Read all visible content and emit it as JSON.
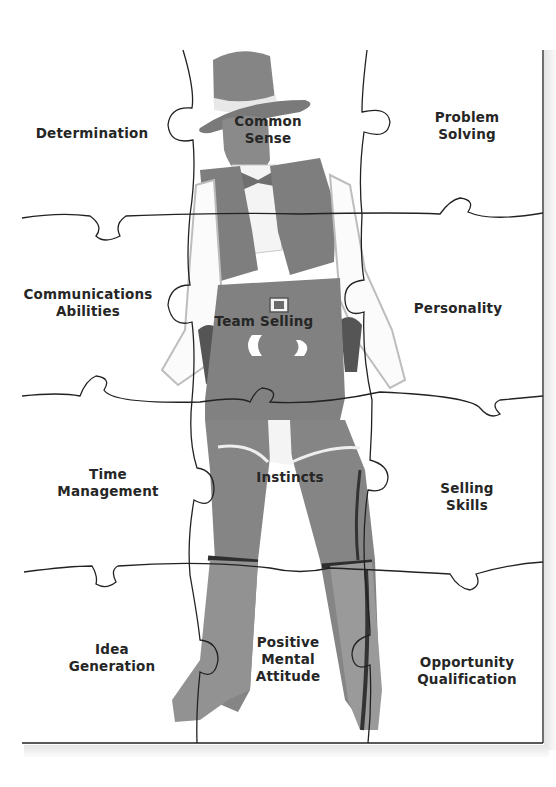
{
  "puzzle": {
    "title": "",
    "colors": {
      "background": "#ffffff",
      "outline": "#222222",
      "figure_fill": "#8a8a8a",
      "figure_dark": "#3a3a3a",
      "label_text": "#262626"
    },
    "pieces": [
      {
        "id": "determination",
        "row": 1,
        "col": 1,
        "lines": [
          "Determination"
        ]
      },
      {
        "id": "common-sense",
        "row": 1,
        "col": 2,
        "lines": [
          "Common",
          "Sense"
        ]
      },
      {
        "id": "problem-solving",
        "row": 1,
        "col": 3,
        "lines": [
          "Problem",
          "Solving"
        ]
      },
      {
        "id": "communications-abilities",
        "row": 2,
        "col": 1,
        "lines": [
          "Communications",
          "Abilities"
        ]
      },
      {
        "id": "team-selling",
        "row": 2,
        "col": 2,
        "lines": [
          "Team Selling"
        ]
      },
      {
        "id": "personality",
        "row": 2,
        "col": 3,
        "lines": [
          "Personality"
        ]
      },
      {
        "id": "time-management",
        "row": 3,
        "col": 1,
        "lines": [
          "Time",
          "Management"
        ]
      },
      {
        "id": "instincts",
        "row": 3,
        "col": 2,
        "lines": [
          "Instincts"
        ]
      },
      {
        "id": "selling-skills",
        "row": 3,
        "col": 3,
        "lines": [
          "Selling",
          "Skills"
        ]
      },
      {
        "id": "idea-generation",
        "row": 4,
        "col": 1,
        "lines": [
          "Idea",
          "Generation"
        ]
      },
      {
        "id": "positive-mental-attitude",
        "row": 4,
        "col": 2,
        "lines": [
          "Positive",
          "Mental",
          "Attitude"
        ]
      },
      {
        "id": "opportunity-qualification",
        "row": 4,
        "col": 3,
        "lines": [
          "Opportunity",
          "Qualification"
        ]
      }
    ],
    "illustration": "cowboy-figure"
  }
}
